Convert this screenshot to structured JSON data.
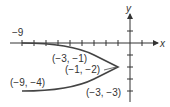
{
  "axes": {
    "x_label": "x",
    "y_label": "y",
    "x_tick_label": "−9"
  },
  "points": [
    {
      "label": "(−3, −1)",
      "x": -3,
      "y": -1
    },
    {
      "label": "(−1, −2)",
      "x": -1,
      "y": -2
    },
    {
      "label": "(−9, −4)",
      "x": -9,
      "y": -4
    },
    {
      "label": "(−3, −3)",
      "x": -3,
      "y": -3
    }
  ],
  "curve": {
    "equation": "x = -2(y+2)^2 - 1",
    "vertex": [
      -1,
      -2
    ],
    "y_range": [
      -4,
      0
    ]
  },
  "colors": {
    "axis": "#333333",
    "curve": "#444444"
  }
}
